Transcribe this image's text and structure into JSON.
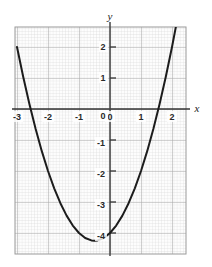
{
  "figure": {
    "background_color": "#ffffff",
    "grid_color": "#b9b9b9",
    "grid_minor_color": "#d4d4d4",
    "axis_color": "#3a3a3a",
    "curve_color": "#1c1c1c",
    "x_axis_label": "x",
    "y_axis_label": "y"
  },
  "chart_data": {
    "type": "line",
    "title": "",
    "xlabel": "x",
    "ylabel": "y",
    "xlim": [
      -3.06,
      2.45
    ],
    "ylim": [
      -4.65,
      2.65
    ],
    "grid": true,
    "grid_major_step": 1,
    "grid_minor_step": 0.1,
    "legend": "none",
    "xticks": [
      -3,
      -2,
      -1,
      0,
      1,
      2
    ],
    "xtick_labels": [
      "-3",
      "-2",
      "-1",
      "0",
      "1",
      "2"
    ],
    "yticks": [
      2,
      1,
      0,
      -1,
      -2,
      -3,
      -4
    ],
    "ytick_labels": [
      "2",
      "1",
      "0",
      "-1",
      "-2",
      "-3",
      "-4"
    ],
    "series": [
      {
        "name": "y = x^2 + x - 4",
        "equation": "y = x^2 + x - 4",
        "vertex": [
          -0.5,
          -4.25
        ],
        "x_intercepts": [
          -2.56,
          1.56
        ],
        "y_intercept": -4,
        "x": [
          -3.0,
          -2.8,
          -2.6,
          -2.4,
          -2.2,
          -2.0,
          -1.8,
          -1.6,
          -1.4,
          -1.2,
          -1.0,
          -0.8,
          -0.6,
          -0.5,
          -0.4,
          -0.2,
          0.0,
          0.2,
          0.4,
          0.6,
          0.8,
          1.0,
          1.2,
          1.4,
          1.6,
          1.8,
          2.0,
          2.2,
          2.4
        ],
        "y": [
          2.0,
          1.04,
          0.16,
          -0.64,
          -1.36,
          -2.0,
          -2.56,
          -3.04,
          -3.44,
          -3.76,
          -4.0,
          -4.16,
          -4.24,
          -4.25,
          -4.24,
          -4.16,
          -4.0,
          -3.76,
          -3.44,
          -3.04,
          -2.56,
          -2.0,
          -1.36,
          -0.64,
          0.16,
          1.04,
          2.0,
          3.04,
          4.16
        ]
      }
    ]
  },
  "ticks": {
    "x": [
      {
        "label": "-3",
        "px": 17,
        "py": 118
      },
      {
        "label": "-2",
        "px": 48,
        "py": 118
      },
      {
        "label": "-1",
        "px": 79,
        "py": 118
      },
      {
        "label": "0",
        "px": 110,
        "py": 118
      },
      {
        "label": "1",
        "px": 141,
        "py": 118
      },
      {
        "label": "2",
        "px": 172,
        "py": 118
      }
    ],
    "y": [
      {
        "label": "2",
        "px": 103,
        "py": 47
      },
      {
        "label": "1",
        "px": 103,
        "py": 78
      },
      {
        "label": "0",
        "px": 103,
        "py": 116
      },
      {
        "label": "-1",
        "px": 101,
        "py": 143
      },
      {
        "label": "-2",
        "px": 101,
        "py": 174
      },
      {
        "label": "-3",
        "px": 101,
        "py": 205
      },
      {
        "label": "-4",
        "px": 101,
        "py": 236
      }
    ]
  }
}
